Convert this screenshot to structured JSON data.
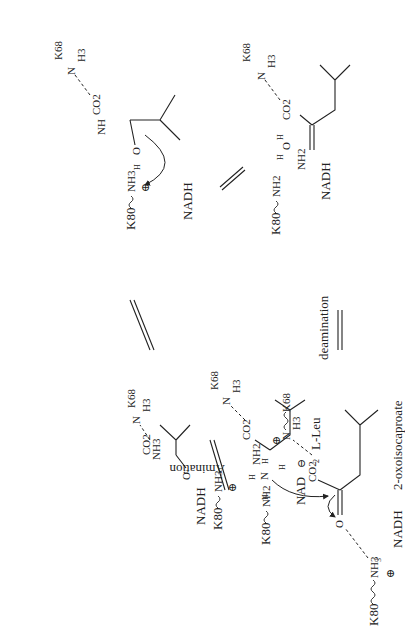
{
  "diagram": {
    "type": "reaction-scheme",
    "orientation": "rotated-90-ccw",
    "steps": [
      {
        "id": "s1",
        "substrate": "2-oxoisocaproate",
        "cofactor": "NADH",
        "lys80": "K80",
        "lys80_group": "NH3",
        "lys68": "K68",
        "lys68_group": "N",
        "lys68_h": "H3",
        "carboxylate": "CO2",
        "carbonyl_o": "O",
        "ammonia": [
          "H",
          "N",
          "H",
          "H"
        ]
      },
      {
        "id": "s2",
        "cofactor": "NADH",
        "lys80": "K80",
        "lys80_group": "NH3",
        "lys68": "K68",
        "lys68_group": "N",
        "lys68_h": "H3",
        "carboxylate": "CO2",
        "alkoxide_o": "O",
        "amine": "NH3"
      },
      {
        "id": "s3",
        "cofactor": "NADH",
        "lys80": "K80",
        "lys80_group": "NH3",
        "lys68": "K68",
        "lys68_group": "N",
        "lys68_h": "H3",
        "carboxylate": "CO2",
        "hydroxyl": [
          "H",
          "O"
        ],
        "amine": "NH"
      },
      {
        "id": "s4",
        "cofactor": "NADH",
        "lys80": "K80",
        "lys80_group": "NH2",
        "lys68": "K68",
        "lys68_group": "N",
        "lys68_h": "H3",
        "carboxylate": "CO2",
        "water": [
          "H",
          "O",
          "H"
        ],
        "iminium": "NH2"
      },
      {
        "id": "s5",
        "product": "L-Leu",
        "cofactor": "NAD",
        "lys80": "K80",
        "lys80_group": "NH2",
        "lys68": "K68",
        "lys68_group": "N",
        "lys68_h": "H3",
        "carboxylate": "CO2",
        "amine": "NH2",
        "alpha_h": "H"
      }
    ],
    "labels": {
      "amination": "Amination",
      "deamination": "deamination"
    },
    "charges": {
      "plus": "⊕",
      "minus": "⊖"
    },
    "subscripts": {
      "two": "2",
      "three": "3"
    }
  }
}
